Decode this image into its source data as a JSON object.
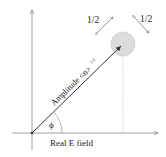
{
  "diagram": {
    "labels": {
      "amplitude": "Amplitude <n>",
      "amplitude_exponent": "1/2",
      "phase": "ϕ",
      "x_axis": "Real E field",
      "uncertainty_left": "1/2",
      "uncertainty_right": "1/2"
    },
    "colors": {
      "axis": "#888888",
      "arrow": "#333333",
      "uncertainty_fill": "#d9d9d9",
      "uncertainty_stroke": "#aaaaaa",
      "text": "#222222"
    }
  }
}
